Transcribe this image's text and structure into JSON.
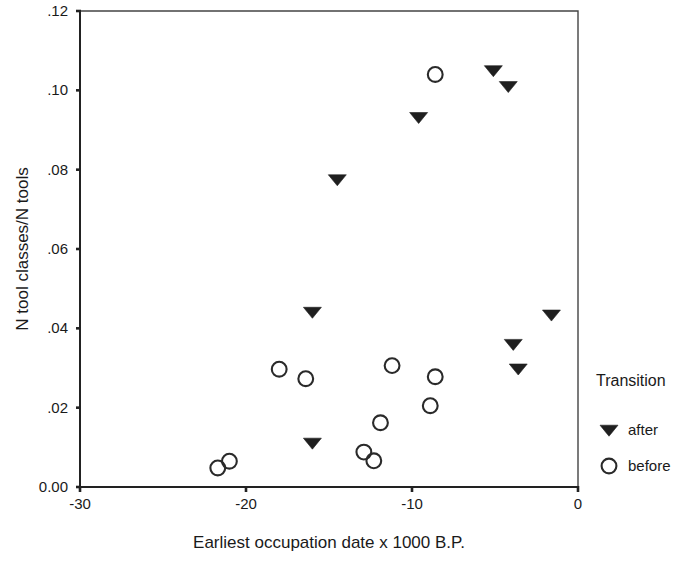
{
  "chart_data": {
    "type": "scatter",
    "title": "",
    "xlabel": "Earliest occupation date x 1000 B.P.",
    "ylabel": "N tool classes/N tools",
    "xlim": [
      -30,
      0
    ],
    "ylim": [
      0.0,
      0.12
    ],
    "xticks": [
      -30,
      -20,
      -10,
      0
    ],
    "xtick_labels": [
      "-30",
      "-20",
      "-10",
      "0"
    ],
    "yticks": [
      0.0,
      0.02,
      0.04,
      0.06,
      0.08,
      0.1,
      0.12
    ],
    "ytick_labels": [
      "0.00",
      ".02",
      ".04",
      ".06",
      ".08",
      ".10",
      ".12"
    ],
    "grid": false,
    "legend": {
      "title": "Transition",
      "position": "right",
      "entries": [
        {
          "label": "after",
          "marker": "filled-down-triangle",
          "color": "#1f1f1f"
        },
        {
          "label": "before",
          "marker": "open-circle",
          "color": "#2a2a2a"
        }
      ]
    },
    "series": [
      {
        "name": "after",
        "marker": "filled-down-triangle",
        "color": "#1f1f1f",
        "points": [
          {
            "x": -16.0,
            "y": 0.0111
          },
          {
            "x": -16.0,
            "y": 0.0441
          },
          {
            "x": -14.5,
            "y": 0.0775
          },
          {
            "x": -9.6,
            "y": 0.0932
          },
          {
            "x": -5.1,
            "y": 0.105
          },
          {
            "x": -4.2,
            "y": 0.101
          },
          {
            "x": -3.9,
            "y": 0.036
          },
          {
            "x": -3.6,
            "y": 0.0298
          },
          {
            "x": -1.6,
            "y": 0.0434
          }
        ]
      },
      {
        "name": "before",
        "marker": "open-circle",
        "color": "#2a2a2a",
        "points": [
          {
            "x": -21.7,
            "y": 0.0048
          },
          {
            "x": -21.0,
            "y": 0.0065
          },
          {
            "x": -18.0,
            "y": 0.0297
          },
          {
            "x": -16.4,
            "y": 0.0273
          },
          {
            "x": -12.9,
            "y": 0.0088
          },
          {
            "x": -12.3,
            "y": 0.0066
          },
          {
            "x": -11.9,
            "y": 0.0162
          },
          {
            "x": -11.2,
            "y": 0.0306
          },
          {
            "x": -8.9,
            "y": 0.0205
          },
          {
            "x": -8.6,
            "y": 0.0278
          },
          {
            "x": -8.6,
            "y": 0.104
          }
        ]
      }
    ]
  }
}
